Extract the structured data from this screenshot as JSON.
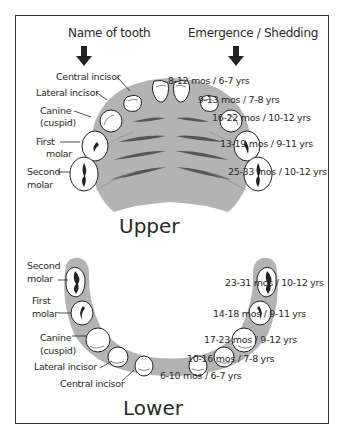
{
  "headers": {
    "left": "Name of tooth",
    "right": "Emergence / Shedding",
    "arrow_icon": "down-arrow-icon"
  },
  "upper": {
    "title": "Upper",
    "names": [
      {
        "label": "Central incisor"
      },
      {
        "label": "Lateral incisor"
      },
      {
        "label": "Canine",
        "sub": "(cuspid)"
      },
      {
        "label": "First",
        "sub": "molar"
      },
      {
        "label": "Second",
        "sub": "molar"
      }
    ],
    "timings": [
      "8-12 mos / 6-7 yrs",
      "9-13 mos / 7-8 yrs",
      "16-22 mos / 10-12 yrs",
      "13-19 mos / 9-11 yrs",
      "25-33 mos / 10-12 yrs"
    ]
  },
  "lower": {
    "title": "Lower",
    "names": [
      {
        "label": "Second",
        "sub": "molar"
      },
      {
        "label": "First",
        "sub": "molar"
      },
      {
        "label": "Canine",
        "sub": "(cuspid)"
      },
      {
        "label": "Lateral incisor"
      },
      {
        "label": "Central incisor"
      }
    ],
    "timings": [
      "23-31 mos / 10-12 yrs",
      "14-18 mos / 9-11 yrs",
      "17-23 mos / 9-12 yrs",
      "10-16 mos / 7-8 yrs",
      "6-10 mos / 6-7 yrs"
    ]
  },
  "colors": {
    "gum": "#b3b3b3",
    "ridge": "#555555",
    "tooth": "#ffffff",
    "outline": "#222222",
    "frame": "#333333"
  }
}
